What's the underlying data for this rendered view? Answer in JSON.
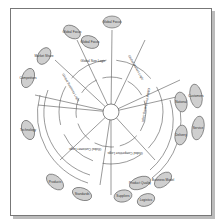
{
  "diagram": {
    "center": "",
    "inner_segments": [
      {
        "label": "Global Size Logic"
      },
      {
        "label": "Global Business Logic"
      },
      {
        "label": "Global Purchasing Logic"
      },
      {
        "label": "Global Customer Logic"
      },
      {
        "label": "Global Competitive Logic"
      },
      {
        "label": "Global Market Logic"
      }
    ],
    "band_labels": [
      "Industry",
      "Strategy",
      "Category",
      "Market"
    ],
    "outer_ovals": [
      {
        "label": "Global Focus"
      },
      {
        "label": "Global Focus"
      },
      {
        "label": "Global Focus"
      },
      {
        "label": "Market Share"
      },
      {
        "label": "Competitors"
      },
      {
        "label": "Technology"
      },
      {
        "label": "Products"
      },
      {
        "label": "Standards"
      },
      {
        "label": "Suppliers"
      },
      {
        "label": "Logistics"
      },
      {
        "label": "Product Quality"
      },
      {
        "label": "Business Model"
      },
      {
        "label": "National"
      },
      {
        "label": "Customers"
      },
      {
        "label": "Delivery"
      },
      {
        "label": "Service"
      },
      {
        "label": "Quality Control"
      }
    ]
  }
}
